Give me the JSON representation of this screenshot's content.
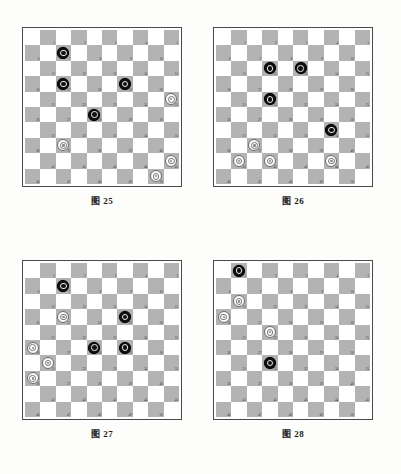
{
  "page": {
    "background_color": "#fdfdfc",
    "light_square_color": "#ffffff",
    "dark_square_color": "#b3b3b3",
    "black_piece_color": "#111111",
    "white_piece_color": "#fbfbfb",
    "border_color": "#4a4a4a"
  },
  "board_spec": {
    "columns": 10,
    "rows": 10,
    "playable_squares": 50,
    "numbering": "1-50 on dark squares, left-to-right, top-to-bottom",
    "square_numbers": [
      1,
      2,
      3,
      4,
      5,
      6,
      7,
      8,
      9,
      10,
      11,
      12,
      13,
      14,
      15,
      16,
      17,
      18,
      19,
      20,
      21,
      22,
      23,
      24,
      25,
      26,
      27,
      28,
      29,
      30,
      31,
      32,
      33,
      34,
      35,
      36,
      37,
      38,
      39,
      40,
      41,
      42,
      43,
      44,
      45,
      46,
      47,
      48,
      49,
      50
    ]
  },
  "diagrams": [
    {
      "id": "diagram-25",
      "caption": "图 25",
      "black_pieces": [
        7,
        17,
        19,
        28
      ],
      "white_pieces": [
        25,
        37,
        45,
        50
      ]
    },
    {
      "id": "diagram-26",
      "caption": "图 26",
      "black_pieces": [
        12,
        13,
        22,
        34
      ],
      "white_pieces": [
        37,
        41,
        42,
        44
      ]
    },
    {
      "id": "diagram-27",
      "caption": "图 27",
      "black_pieces": [
        7,
        19,
        28,
        29
      ],
      "white_pieces": [
        17,
        26,
        31,
        36
      ]
    },
    {
      "id": "diagram-28",
      "caption": "图 28",
      "black_pieces": [
        1,
        32
      ],
      "white_pieces": [
        11,
        16,
        22
      ]
    }
  ]
}
